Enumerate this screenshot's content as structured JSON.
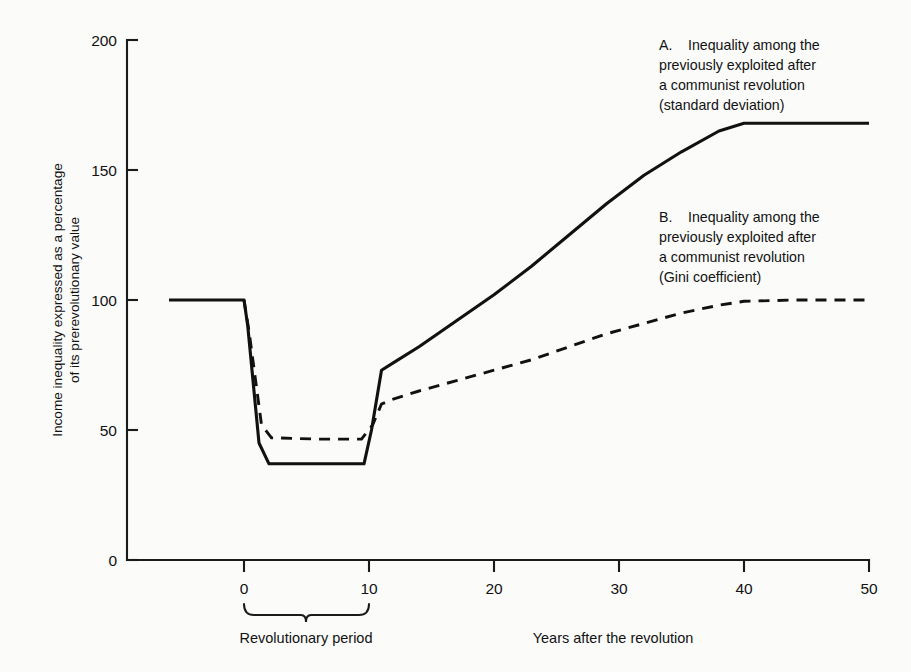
{
  "chart_data": {
    "type": "line",
    "title": "",
    "xlabel": "Years after the revolution",
    "ylabel": "Income inequality expressed as a percentage of its prerevolutionary value",
    "ylabel_line1": "Income inequality expressed as a percentage",
    "ylabel_line2": "of its prerevolutionary value",
    "xlim": [
      -6,
      50
    ],
    "ylim": [
      0,
      200
    ],
    "xticks": [
      0,
      10,
      20,
      30,
      40,
      50
    ],
    "yticks": [
      0,
      50,
      100,
      150,
      200
    ],
    "xtick_labels": [
      "0",
      "10",
      "20",
      "30",
      "40",
      "50"
    ],
    "ytick_labels": [
      "0",
      "50",
      "100",
      "150",
      "200"
    ],
    "grid": false,
    "legend_position": "inline-annotations",
    "series": [
      {
        "name": "A",
        "style": "solid",
        "label_letter": "A.",
        "label_lines": [
          "Inequality among the",
          "previously exploited after",
          "a communist revolution",
          "(standard deviation)"
        ],
        "x": [
          -6,
          0,
          0.3,
          1.2,
          2,
          5,
          9.6,
          10.2,
          11,
          12,
          14,
          17,
          20,
          23,
          26,
          29,
          32,
          35,
          38,
          40,
          44,
          50
        ],
        "y": [
          100,
          100,
          90,
          45,
          37,
          37,
          37,
          50,
          73,
          76,
          82,
          92,
          102,
          113,
          125,
          137,
          148,
          157,
          165,
          168,
          168,
          168
        ]
      },
      {
        "name": "B",
        "style": "dashed",
        "label_letter": "B.",
        "label_lines": [
          "Inequality among the",
          "previously exploited after",
          "a communist revolution",
          "(Gini coefficient)"
        ],
        "x": [
          0,
          0.4,
          1.4,
          2.2,
          6,
          9.4,
          10.3,
          11,
          12,
          14,
          17,
          20,
          23,
          26,
          29,
          32,
          35,
          38,
          40,
          44,
          50
        ],
        "y": [
          100,
          88,
          52,
          47,
          46.5,
          46.5,
          52,
          60,
          62,
          65,
          69,
          73,
          77,
          82,
          87,
          91,
          95,
          98,
          99.5,
          100,
          100
        ]
      }
    ],
    "annotations": [
      {
        "name": "revolutionary-period",
        "text": "Revolutionary period",
        "x_start": 0,
        "x_end": 10
      }
    ]
  }
}
